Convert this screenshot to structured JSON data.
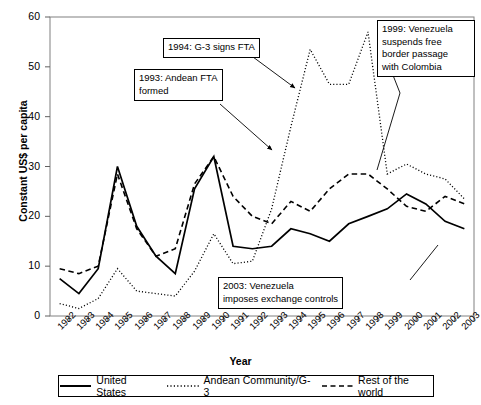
{
  "chart_data": {
    "type": "line",
    "title": "",
    "xlabel": "Year",
    "ylabel": "Constant US$ per capita",
    "ylim": [
      0,
      60
    ],
    "ytick_values": [
      0,
      10,
      20,
      30,
      40,
      50,
      60
    ],
    "grid": false,
    "legend_position": "below-axes",
    "categories": [
      "1982",
      "1983",
      "1984",
      "1985",
      "1986",
      "1987",
      "1988",
      "1989",
      "1990",
      "1991",
      "1992",
      "1993",
      "1994",
      "1995",
      "1996",
      "1997",
      "1998",
      "1999",
      "2000",
      "2001",
      "2002",
      "2003"
    ],
    "series": [
      {
        "name": "United States",
        "style": "solid",
        "values": [
          7.5,
          4.5,
          9.5,
          30.0,
          18.0,
          12.0,
          8.5,
          25.5,
          32.0,
          14.0,
          13.5,
          14.0,
          17.5,
          16.5,
          15.0,
          18.5,
          20.0,
          21.5,
          24.5,
          22.5,
          19.0,
          17.5
        ]
      },
      {
        "name": "Andean Community/G-3",
        "style": "dotted",
        "values": [
          2.5,
          1.5,
          3.5,
          9.5,
          5.0,
          4.5,
          4.0,
          9.0,
          16.5,
          10.5,
          11.0,
          21.5,
          38.0,
          53.5,
          46.5,
          46.5,
          57.0,
          28.5,
          30.5,
          28.5,
          27.5,
          23.5
        ]
      },
      {
        "name": "Rest of the world",
        "style": "dashed",
        "values": [
          9.5,
          8.5,
          10.0,
          28.5,
          17.5,
          12.0,
          13.5,
          26.5,
          32.0,
          24.0,
          20.0,
          18.5,
          23.0,
          21.0,
          25.5,
          28.5,
          28.5,
          25.5,
          22.0,
          21.0,
          24.0,
          22.5
        ]
      }
    ]
  },
  "annotations": [
    {
      "id": "1994",
      "text": "1994: G-3 signs FTA",
      "arrow": {
        "x1": 253,
        "y1": 57,
        "x2": 295,
        "y2": 88
      }
    },
    {
      "id": "1993",
      "text": "1993: Andean FTA\nformed",
      "arrow": {
        "x1": 220,
        "y1": 104,
        "x2": 272,
        "y2": 150
      }
    },
    {
      "id": "1999",
      "text": "1999: Venezuela\nsuspends free\nborder passage\nwith Colombia",
      "arrow": {
        "x1": 400,
        "y1": 93,
        "x2": 377,
        "y2": 170
      }
    },
    {
      "id": "2003",
      "text": "2003: Venezuela\nimposes exchange controls",
      "arrow": {
        "x1": 410,
        "y1": 280,
        "x2": 438,
        "y2": 245
      }
    }
  ],
  "legend": {
    "entries": [
      {
        "label": "United States",
        "style": "solid"
      },
      {
        "label": "Andean Community/G-3",
        "style": "dotted"
      },
      {
        "label": "Rest of the world",
        "style": "dashed"
      }
    ]
  }
}
